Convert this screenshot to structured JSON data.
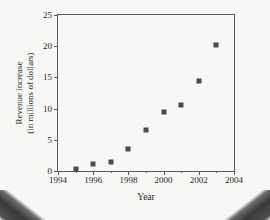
{
  "figure": {
    "background_color": "#f7f7f5",
    "frame_color": "#5a5a5a",
    "marker_color": "#4a4a4a"
  },
  "chart_data": {
    "type": "scatter",
    "title": "",
    "xlabel": "Year",
    "ylabel": "Revenue increase\n(in millions of dollars)",
    "ylabel_line1": "Revenue increase",
    "ylabel_line2": "(in millions of dollars)",
    "xlim": [
      1994,
      2004
    ],
    "ylim": [
      0,
      25
    ],
    "xticks": [
      1994,
      1996,
      1998,
      2000,
      2002,
      2004
    ],
    "xtick_labels": [
      "1994",
      "1996",
      "1998",
      "2000",
      "2002",
      "2004"
    ],
    "xminor_ticks": [
      1995,
      1997,
      1999,
      2001,
      2003
    ],
    "yticks": [
      0,
      5,
      10,
      15,
      20,
      25
    ],
    "ytick_labels": [
      "0",
      "5",
      "10",
      "15",
      "20",
      "25"
    ],
    "grid": false,
    "legend": null,
    "marker": "square",
    "x": [
      1995,
      1996,
      1997,
      1998,
      1999,
      2000,
      2001,
      2002,
      2003
    ],
    "values": [
      0.4,
      1.1,
      1.5,
      3.6,
      6.5,
      9.5,
      10.5,
      14.4,
      20.2
    ],
    "points": [
      {
        "x": 1995,
        "y": 0.4
      },
      {
        "x": 1996,
        "y": 1.1
      },
      {
        "x": 1997,
        "y": 1.5
      },
      {
        "x": 1998,
        "y": 3.6
      },
      {
        "x": 1999,
        "y": 6.5
      },
      {
        "x": 2000,
        "y": 9.5
      },
      {
        "x": 2001,
        "y": 10.5
      },
      {
        "x": 2002,
        "y": 14.4
      },
      {
        "x": 2003,
        "y": 20.2
      }
    ]
  }
}
